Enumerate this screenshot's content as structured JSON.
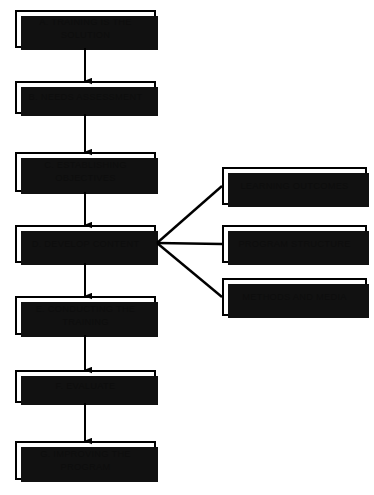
{
  "diagram": {
    "background_color": "#ffffff",
    "box_fill_color": "#ffffff",
    "box_border_color": "#000000",
    "shadow_color": "#111111",
    "line_color": "#000000",
    "main_sequence": [
      {
        "id": "A",
        "label": "A.  TRAINING IS THE\nSOLUTION",
        "x": 15,
        "y": 10,
        "width": 141,
        "height": 38
      },
      {
        "id": "B",
        "label": "B.  NEEDS ASSESSMENT",
        "x": 15,
        "y": 81,
        "width": 141,
        "height": 33
      },
      {
        "id": "C",
        "label": "C.  ESTABLISHING\nOBJECTIVES",
        "x": 15,
        "y": 152,
        "width": 141,
        "height": 40
      },
      {
        "id": "D",
        "label": "D.  DEVELOP CONTENT",
        "x": 15,
        "y": 225,
        "width": 141,
        "height": 38
      },
      {
        "id": "E",
        "label": "E. CONDUCTING THE\nTRAINING",
        "x": 15,
        "y": 296,
        "width": 141,
        "height": 39
      },
      {
        "id": "F",
        "label": "F. EVALUATE",
        "x": 15,
        "y": 370,
        "width": 141,
        "height": 33
      },
      {
        "id": "G",
        "label": "G.  IMPROVING THE\nPROGRAM",
        "x": 15,
        "y": 441,
        "width": 141,
        "height": 39
      }
    ],
    "branches": [
      {
        "id": "branch-learning-outcomes",
        "label": "LEARNING OUTCOMES",
        "x": 222,
        "y": 167,
        "width": 145,
        "height": 38
      },
      {
        "id": "branch-program-structure",
        "label": "PROGRAM STRUCTURE",
        "x": 222,
        "y": 225,
        "width": 145,
        "height": 38
      },
      {
        "id": "branch-methods-and-media",
        "label": "METHODS AND MEDIA",
        "x": 222,
        "y": 278,
        "width": 145,
        "height": 38
      }
    ],
    "arrows": [
      {
        "id": "arrow-a-b",
        "from": "A",
        "to": "B",
        "x": 85,
        "y_start": 48,
        "y_end": 81
      },
      {
        "id": "arrow-b-c",
        "from": "B",
        "to": "C",
        "x": 85,
        "y_start": 114,
        "y_end": 152
      },
      {
        "id": "arrow-c-d",
        "from": "C",
        "to": "D",
        "x": 85,
        "y_start": 192,
        "y_end": 225
      },
      {
        "id": "arrow-d-e",
        "from": "D",
        "to": "E",
        "x": 85,
        "y_start": 263,
        "y_end": 296
      },
      {
        "id": "arrow-e-f",
        "from": "E",
        "to": "F",
        "x": 85,
        "y_start": 335,
        "y_end": 370
      },
      {
        "id": "arrow-f-g",
        "from": "F",
        "to": "G",
        "x": 85,
        "y_start": 403,
        "y_end": 441
      }
    ],
    "branch_lines": [
      {
        "id": "line-d-learning-outcomes",
        "x1": 157,
        "y1": 243,
        "x2": 222,
        "y2": 186
      },
      {
        "id": "line-d-program-structure",
        "x1": 157,
        "y1": 243,
        "x2": 222,
        "y2": 244
      },
      {
        "id": "line-d-methods-and-media",
        "x1": 157,
        "y1": 243,
        "x2": 222,
        "y2": 297
      }
    ]
  }
}
